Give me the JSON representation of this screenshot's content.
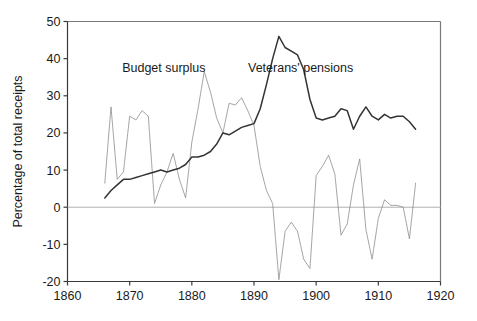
{
  "chart_data": {
    "type": "line",
    "title": "",
    "subtitle": "",
    "xlabel": "",
    "ylabel": "Percentage of total receipts",
    "xlim": [
      1860,
      1920
    ],
    "ylim": [
      -20,
      50
    ],
    "xticks": [
      1860,
      1870,
      1880,
      1890,
      1900,
      1910,
      1920
    ],
    "yticks": [
      -20,
      -10,
      0,
      10,
      20,
      30,
      40,
      50
    ],
    "xtick_labels": [
      "1860",
      "1870",
      "1880",
      "1890",
      "1900",
      "1910",
      "1920"
    ],
    "ytick_labels": [
      "-20",
      "-10",
      "0",
      "10",
      "20",
      "30",
      "40",
      "50"
    ],
    "grid": false,
    "zero_line": true,
    "legend_position": "inline-annotations",
    "annotations": [
      {
        "text": "Budget surplus",
        "x": 1875.5,
        "y": 36.5,
        "series": "Budget surplus"
      },
      {
        "text": "Veterans' pensions",
        "x": 1897.5,
        "y": 36.5,
        "series": "Veterans' pensions"
      }
    ],
    "series": [
      {
        "name": "Budget surplus",
        "color": "#8c8c8c",
        "style": "dotted-thin",
        "x": [
          1866,
          1867,
          1868,
          1869,
          1870,
          1871,
          1872,
          1873,
          1874,
          1875,
          1876,
          1877,
          1878,
          1879,
          1880,
          1881,
          1882,
          1883,
          1884,
          1885,
          1886,
          1887,
          1888,
          1889,
          1890,
          1891,
          1892,
          1893,
          1894,
          1895,
          1896,
          1897,
          1898,
          1899,
          1900,
          1901,
          1902,
          1903,
          1904,
          1905,
          1906,
          1907,
          1908,
          1909,
          1910,
          1911,
          1912,
          1913,
          1914,
          1915,
          1916
        ],
        "y": [
          6.5,
          27.0,
          7.5,
          9.5,
          24.5,
          23.5,
          26.0,
          24.5,
          1.0,
          6.0,
          9.5,
          14.5,
          7.5,
          2.5,
          17.5,
          26.5,
          36.5,
          31.0,
          24.0,
          20.0,
          28.0,
          27.5,
          29.5,
          26.0,
          22.0,
          11.0,
          4.5,
          1.0,
          -19.5,
          -6.5,
          -4.0,
          -6.5,
          -14.0,
          -16.5,
          8.5,
          11.0,
          14.0,
          9.0,
          -7.5,
          -4.5,
          6.0,
          13.0,
          -6.0,
          -14.0,
          -3.0,
          2.0,
          0.5,
          0.5,
          0.0,
          -8.5,
          6.5
        ]
      },
      {
        "name": "Veterans' pensions",
        "color": "#333333",
        "style": "solid",
        "x": [
          1866,
          1867,
          1868,
          1869,
          1870,
          1871,
          1872,
          1873,
          1874,
          1875,
          1876,
          1877,
          1878,
          1879,
          1880,
          1881,
          1882,
          1883,
          1884,
          1885,
          1886,
          1887,
          1888,
          1889,
          1890,
          1891,
          1892,
          1893,
          1894,
          1895,
          1896,
          1897,
          1898,
          1899,
          1900,
          1901,
          1902,
          1903,
          1904,
          1905,
          1906,
          1907,
          1908,
          1909,
          1910,
          1911,
          1912,
          1913,
          1914,
          1915,
          1916
        ],
        "y": [
          2.5,
          4.5,
          6.0,
          7.5,
          7.5,
          8.0,
          8.5,
          9.0,
          9.5,
          10.0,
          9.5,
          10.0,
          10.5,
          11.5,
          13.5,
          13.5,
          14.0,
          15.0,
          17.0,
          20.0,
          19.5,
          20.5,
          21.5,
          22.0,
          22.5,
          26.5,
          33.0,
          40.0,
          46.0,
          43.0,
          42.0,
          41.0,
          37.0,
          29.0,
          24.0,
          23.5,
          24.0,
          24.5,
          26.5,
          26.0,
          21.0,
          24.5,
          27.0,
          24.5,
          23.5,
          25.0,
          24.0,
          24.5,
          24.5,
          23.0,
          21.0
        ]
      }
    ]
  },
  "axes": {
    "y_axis_title": "Percentage of total receipts"
  }
}
